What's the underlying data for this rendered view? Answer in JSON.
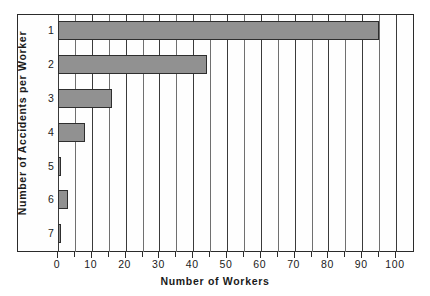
{
  "chart_data": {
    "type": "bar",
    "orientation": "horizontal",
    "title": "",
    "xlabel": "Number of Workers",
    "ylabel": "Number of Accidents per Worker",
    "categories": [
      "1",
      "2",
      "3",
      "4",
      "5",
      "6",
      "7"
    ],
    "values": [
      95,
      44,
      16,
      8,
      1,
      3,
      1
    ],
    "xlim": [
      0,
      100
    ],
    "x_major_ticks": [
      0,
      10,
      20,
      30,
      40,
      50,
      60,
      70,
      80,
      90,
      100
    ],
    "x_minor_ticks": [
      5,
      15,
      25,
      35,
      45,
      55,
      65,
      75,
      85,
      95
    ],
    "x_tick_labels": [
      "0",
      "10",
      "20",
      "30",
      "40",
      "50",
      "60",
      "70",
      "80",
      "90",
      "100"
    ],
    "grid": "vertical-major-and-minor",
    "legend": "none",
    "bar_fill_color": "#919191",
    "bar_edge_color": "#2e2e2e",
    "frame_color": "#2b2b2b",
    "background_color": "#ffffff"
  }
}
